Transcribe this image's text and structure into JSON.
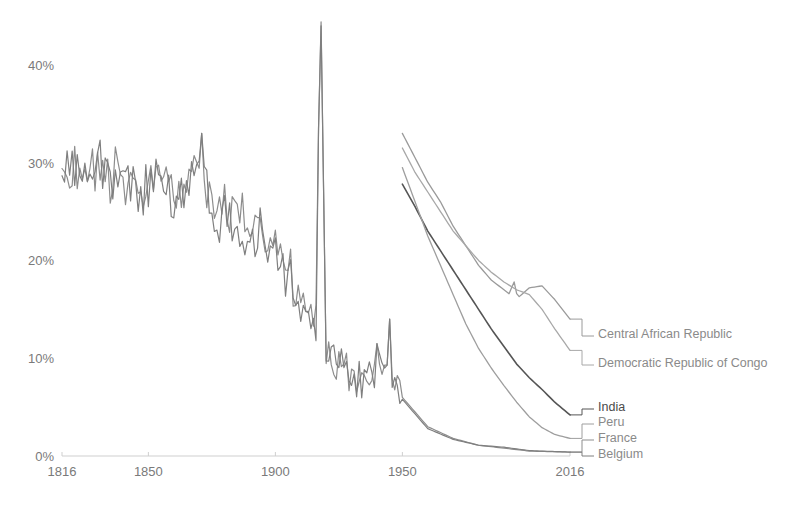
{
  "chart_data": {
    "type": "line",
    "title": "",
    "subtitle": "",
    "xlabel": "",
    "ylabel": "",
    "xlim": [
      1816,
      2016
    ],
    "ylim": [
      0,
      45
    ],
    "grid": false,
    "legend_position": "right-inline",
    "y_ticks": [
      "0%",
      "10%",
      "20%",
      "30%",
      "40%"
    ],
    "y_tick_values": [
      0,
      10,
      20,
      30,
      40
    ],
    "x_ticks": [
      "1816",
      "1850",
      "1900",
      "1950",
      "2016"
    ],
    "x_tick_values": [
      1816,
      1850,
      1900,
      1950,
      2016
    ],
    "series": [
      {
        "name": "Central African Republic",
        "color": "#9a9a9a",
        "width": 1.3,
        "end_value": 14.0,
        "x": [
          1950,
          1955,
          1960,
          1965,
          1970,
          1975,
          1980,
          1985,
          1990,
          1992,
          1994,
          1995,
          1996,
          2000,
          2005,
          2010,
          2016
        ],
        "values": [
          33.0,
          30.5,
          28.0,
          26.0,
          23.5,
          21.5,
          19.5,
          18.0,
          17.0,
          16.6,
          17.8,
          16.6,
          16.3,
          17.2,
          17.4,
          16.0,
          14.0
        ]
      },
      {
        "name": "Democratic Republic of Congo",
        "color": "#a8a8a8",
        "width": 1.3,
        "end_value": 10.8,
        "x": [
          1950,
          1955,
          1960,
          1965,
          1970,
          1975,
          1980,
          1985,
          1990,
          1995,
          2000,
          2005,
          2010,
          2016
        ],
        "values": [
          31.5,
          29.0,
          27.0,
          25.0,
          23.0,
          21.5,
          20.0,
          18.8,
          17.8,
          17.0,
          16.5,
          15.0,
          13.0,
          10.8
        ]
      },
      {
        "name": "India",
        "color": "#555555",
        "width": 1.6,
        "end_value": 4.2,
        "x": [
          1950,
          1955,
          1960,
          1965,
          1970,
          1975,
          1980,
          1985,
          1990,
          1995,
          2000,
          2005,
          2010,
          2016
        ],
        "values": [
          27.8,
          25.5,
          23.0,
          21.0,
          19.0,
          17.0,
          15.0,
          13.0,
          11.2,
          9.4,
          8.0,
          6.8,
          5.5,
          4.2
        ]
      },
      {
        "name": "Peru",
        "color": "#9e9e9e",
        "width": 1.3,
        "end_value": 1.8,
        "x": [
          1950,
          1955,
          1960,
          1965,
          1970,
          1975,
          1980,
          1985,
          1990,
          1995,
          2000,
          2005,
          2010,
          2016
        ],
        "values": [
          29.5,
          26.0,
          22.5,
          19.5,
          16.5,
          13.5,
          11.0,
          9.0,
          7.2,
          5.5,
          4.0,
          2.9,
          2.2,
          1.8
        ]
      },
      {
        "name": "France",
        "color": "#8d8d8d",
        "width": 1.2,
        "end_value": 0.4,
        "x": [
          1816,
          1820,
          1825,
          1830,
          1835,
          1840,
          1845,
          1850,
          1855,
          1860,
          1865,
          1870,
          1875,
          1880,
          1885,
          1890,
          1895,
          1900,
          1905,
          1910,
          1915,
          1918,
          1920,
          1925,
          1930,
          1935,
          1940,
          1945,
          1950,
          1960,
          1970,
          1980,
          1990,
          2000,
          2016
        ],
        "values": [
          28.0,
          29.5,
          28.7,
          30.0,
          28.5,
          29.0,
          27.5,
          28.0,
          30.5,
          26.0,
          29.0,
          31.0,
          26.0,
          25.5,
          23.5,
          24.0,
          22.5,
          21.0,
          19.0,
          15.5,
          14.0,
          13.0,
          11.0,
          9.5,
          8.5,
          8.0,
          9.0,
          8.5,
          6.0,
          3.0,
          1.8,
          1.1,
          0.8,
          0.5,
          0.4
        ]
      },
      {
        "name": "Belgium",
        "color": "#7f7f7f",
        "width": 1.2,
        "end_value": 0.4,
        "x": [
          1816,
          1820,
          1825,
          1830,
          1835,
          1840,
          1845,
          1850,
          1855,
          1860,
          1865,
          1870,
          1875,
          1880,
          1885,
          1890,
          1895,
          1900,
          1905,
          1910,
          1915,
          1918,
          1920,
          1925,
          1930,
          1935,
          1940,
          1945,
          1950,
          1960,
          1970,
          1980,
          1990,
          2000,
          2016
        ],
        "values": [
          27.5,
          29.0,
          28.0,
          29.5,
          28.0,
          28.5,
          27.0,
          27.5,
          29.5,
          25.5,
          28.5,
          30.5,
          25.5,
          25.0,
          23.0,
          23.5,
          22.0,
          20.5,
          18.5,
          15.0,
          13.5,
          12.5,
          10.8,
          9.2,
          8.2,
          7.8,
          9.5,
          8.8,
          5.8,
          2.8,
          1.7,
          1.1,
          0.9,
          0.55,
          0.4
        ]
      }
    ],
    "annotations": [
      {
        "label": "1918 influenza pandemic spike",
        "x": 1918,
        "y": 44.0
      }
    ]
  },
  "legend": {
    "items": [
      {
        "label": "Central African Republic",
        "color": "#9a9a9a",
        "emphasis": false
      },
      {
        "label": "Democratic Republic of Congo",
        "color": "#a8a8a8",
        "emphasis": false
      },
      {
        "label": "India",
        "color": "#555555",
        "emphasis": true
      },
      {
        "label": "Peru",
        "color": "#9e9e9e",
        "emphasis": false
      },
      {
        "label": "France",
        "color": "#8d8d8d",
        "emphasis": false
      },
      {
        "label": "Belgium",
        "color": "#7f7f7f",
        "emphasis": false
      }
    ]
  },
  "axes": {
    "y_labels": [
      "40%",
      "30%",
      "20%",
      "10%",
      "0%"
    ],
    "x_labels": [
      "1816",
      "1850",
      "1900",
      "1950",
      "2016"
    ]
  },
  "colors": {
    "background": "#ffffff",
    "axis": "#cfcfcf",
    "tick_text": "#7a7a7a",
    "legend_text": "#8a8a8a",
    "legend_text_dark": "#4a4a4a"
  }
}
